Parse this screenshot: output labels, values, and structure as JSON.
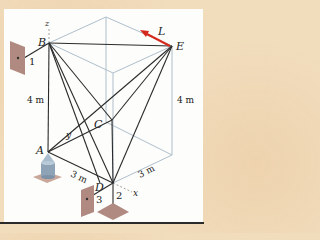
{
  "figure": {
    "points": {
      "A": "A",
      "B": "B",
      "C": "C",
      "D": "D",
      "E": "E"
    },
    "axes": {
      "x": "x",
      "y": "y",
      "z": "z"
    },
    "force_label": "L",
    "dimensions": {
      "left_height": "4 m",
      "right_height": "4 m",
      "front_depth": "3 m",
      "side_width": "3 m"
    },
    "supports": {
      "wall_1": "1",
      "ground_2": "2",
      "wall_3": "3"
    },
    "colors": {
      "background": "#f1dcbc",
      "panel": "#fdfdfb",
      "member": "#2b2b2b",
      "box_edge": "#aebfcc",
      "force_arrow": "#d42a1e",
      "support": "#b08a80"
    }
  }
}
